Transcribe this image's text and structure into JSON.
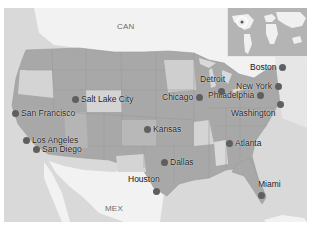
{
  "map": {
    "region": "United States",
    "colors": {
      "water": "#d9d9d9",
      "foreign_land": "#f2f2f2",
      "state_dark": "#a6a6a6",
      "state_mid": "#b3b3b3",
      "state_light": "#d4d4d4",
      "marker": "#5f5f5f",
      "label": "#1a1a1a"
    },
    "country_labels": [
      {
        "label": "CAN",
        "x": 113,
        "y": 22
      },
      {
        "label": "MEX",
        "x": 101,
        "y": 204
      }
    ],
    "cities": [
      {
        "name": "Boston",
        "label": "Boston",
        "x": 284,
        "y": 67,
        "label_side": "left"
      },
      {
        "name": "New York",
        "label": "New York",
        "x": 278,
        "y": 86,
        "label_side": "left"
      },
      {
        "name": "Philadelphia",
        "label": "Philadelphia",
        "x": 272,
        "y": 95,
        "label_side": "left"
      },
      {
        "name": "Washington",
        "label": "Washington",
        "x": 266,
        "y": 104,
        "label_side": "left"
      },
      {
        "name": "Detroit",
        "label": "Detroit",
        "x": 227,
        "y": 90,
        "label_side": "above"
      },
      {
        "name": "Chicago",
        "label": "Chicago",
        "x": 204,
        "y": 97,
        "label_side": "left"
      },
      {
        "name": "Atlanta",
        "label": "Atlanta",
        "x": 230,
        "y": 143,
        "label_side": "right"
      },
      {
        "name": "Miami",
        "label": "Miami",
        "x": 264,
        "y": 197,
        "label_side": "above"
      },
      {
        "name": "Salt Lake City",
        "label": "Salt Lake City",
        "x": 76,
        "y": 99,
        "label_side": "right"
      },
      {
        "name": "San Francisco",
        "label": "San Francisco",
        "x": 16,
        "y": 113,
        "label_side": "right"
      },
      {
        "name": "Los Angeles",
        "label": "Los Angeles",
        "x": 27,
        "y": 140,
        "label_side": "right"
      },
      {
        "name": "San Diego",
        "label": "San Diego",
        "x": 37,
        "y": 149,
        "label_side": "right"
      },
      {
        "name": "Kansas",
        "label": "Kansas",
        "x": 148,
        "y": 129,
        "label_side": "right"
      },
      {
        "name": "Dallas",
        "label": "Dallas",
        "x": 165,
        "y": 162,
        "label_side": "right"
      },
      {
        "name": "Houston",
        "label": "Houston",
        "x": 161,
        "y": 190,
        "label_side": "above"
      }
    ],
    "inset": {
      "label": "World overview",
      "highlight": "United States"
    }
  }
}
